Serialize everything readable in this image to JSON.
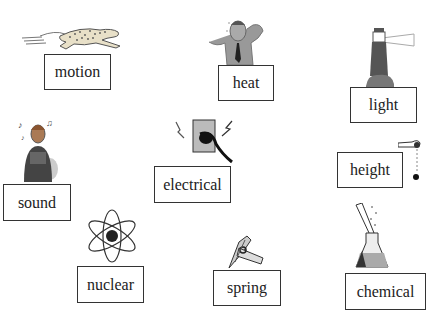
{
  "items": [
    {
      "label": "motion",
      "icon": "running-cheetah"
    },
    {
      "label": "heat",
      "icon": "sweating-man"
    },
    {
      "label": "light",
      "icon": "lighthouse"
    },
    {
      "label": "sound",
      "icon": "singing-person"
    },
    {
      "label": "electrical",
      "icon": "wall-outlet-plug"
    },
    {
      "label": "height",
      "icon": "hand-dropping-ball"
    },
    {
      "label": "nuclear",
      "icon": "atom"
    },
    {
      "label": "spring",
      "icon": "clothespin-spring"
    },
    {
      "label": "chemical",
      "icon": "flask-test-tube"
    }
  ]
}
